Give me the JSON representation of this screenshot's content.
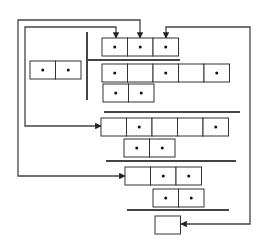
{
  "diagram": {
    "stroke_color": "#333333",
    "line_color": "#444444",
    "dot_color": "#111111",
    "background": "#ffffff",
    "cell_width": 25.5,
    "cell_height": 18,
    "rows": [
      {
        "id": "row-top",
        "x": 102,
        "y": 38,
        "cells": [
          true,
          true,
          true
        ]
      },
      {
        "id": "row-left-pair",
        "x": 30,
        "y": 61,
        "cells": [
          true,
          true
        ]
      },
      {
        "id": "row-2",
        "x": 102,
        "y": 64,
        "cells": [
          true,
          false,
          true,
          false,
          true
        ]
      },
      {
        "id": "row-3",
        "x": 103,
        "y": 84,
        "cells": [
          true,
          true
        ]
      },
      {
        "id": "row-4",
        "x": 101,
        "y": 118,
        "cells": [
          false,
          true,
          false,
          false,
          true
        ]
      },
      {
        "id": "row-5",
        "x": 124,
        "y": 139,
        "cells": [
          true,
          true
        ]
      },
      {
        "id": "row-6",
        "x": 125,
        "y": 167,
        "cells": [
          false,
          true,
          true
        ]
      },
      {
        "id": "row-7",
        "x": 153,
        "y": 189,
        "cells": [
          true,
          true
        ]
      },
      {
        "id": "row-last",
        "x": 155,
        "y": 216,
        "cells": [
          false
        ]
      }
    ],
    "separators": [
      {
        "id": "vertical-divider",
        "x1": 87,
        "y1": 32,
        "x2": 87,
        "y2": 100
      },
      {
        "id": "hline-1",
        "x1": 87,
        "y1": 60,
        "x2": 180,
        "y2": 60
      },
      {
        "id": "hline-2",
        "x1": 104,
        "y1": 112,
        "x2": 240,
        "y2": 112
      },
      {
        "id": "hline-3",
        "x1": 106,
        "y1": 161,
        "x2": 236,
        "y2": 161
      },
      {
        "id": "hline-4",
        "x1": 127,
        "y1": 210,
        "x2": 229,
        "y2": 210
      }
    ],
    "arrows": [
      {
        "id": "arrow-row4-to-top-cell1",
        "points": "101,126 25,126 25,27 116,27 116,38",
        "heads": [
          "left-at-25-126",
          "down-at-116-38"
        ]
      },
      {
        "id": "arrow-row6-to-top-cell2",
        "points": "125,176 18,176 18,20 140,20 140,38",
        "heads": [
          "left-at-18-176",
          "down-at-140-38"
        ]
      },
      {
        "id": "arrow-last-to-top-cell3",
        "points": "181,224 250,224 250,27 166,27 166,38",
        "heads": [
          "right-at-250-224",
          "down-at-166-38"
        ]
      }
    ]
  }
}
